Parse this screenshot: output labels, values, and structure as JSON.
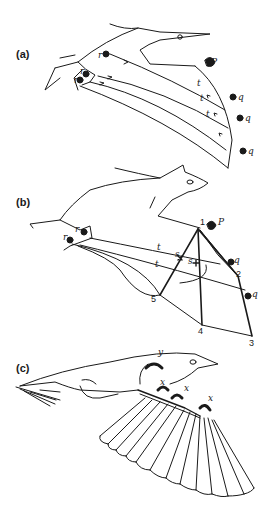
{
  "figure": {
    "panels": [
      {
        "id": "a",
        "label": "(a)",
        "subject": "pterosaur",
        "labels": {
          "r1": "r",
          "r2": "r",
          "r3": "r",
          "p": "P",
          "t1": "t",
          "t2": "t",
          "t3": "t",
          "q1": "q",
          "q2": "q",
          "q3": "q"
        }
      },
      {
        "id": "b",
        "label": "(b)",
        "subject": "bat",
        "labels": {
          "r1": "r",
          "r2": "r",
          "p": "P",
          "t1": "t",
          "t2": "t",
          "s1": "s",
          "s2": "s",
          "q1": "q",
          "q2": "q"
        },
        "digits": [
          "1",
          "2",
          "3",
          "4",
          "5"
        ]
      },
      {
        "id": "c",
        "label": "(c)",
        "subject": "bird",
        "labels": {
          "y": "y",
          "x1": "x",
          "x2": "x",
          "x3": "x"
        }
      }
    ],
    "colors": {
      "ink": "#1a1a1a",
      "shade": "#c8c8c8",
      "background": "#ffffff"
    }
  }
}
